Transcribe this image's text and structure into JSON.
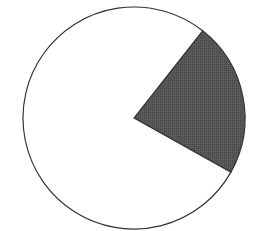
{
  "chart_data": {
    "type": "pie",
    "title": "",
    "categories": [
      "Shaded sector",
      "Remainder"
    ],
    "values": [
      22.5,
      77.5
    ],
    "colors": [
      "#555555",
      "#ffffff"
    ],
    "outline_color": "#333333",
    "start_angle_deg": -51.8,
    "legend": "none",
    "labels_shown": false
  }
}
